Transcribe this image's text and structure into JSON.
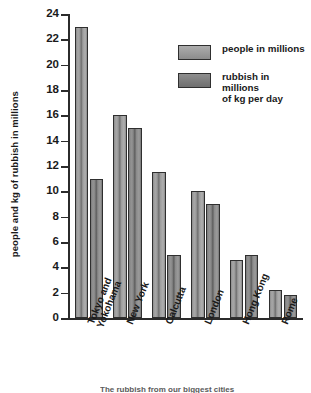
{
  "chart_data": {
    "type": "bar",
    "title": "",
    "xlabel": "",
    "ylabel": "people and kg of rubbish in millions",
    "ylim": [
      0,
      24
    ],
    "ytick_step": 2,
    "yticks": [
      0,
      2,
      4,
      6,
      8,
      10,
      12,
      14,
      16,
      18,
      20,
      22,
      24
    ],
    "grid": false,
    "legend_position": "top-right",
    "categories": [
      "Tokyo and Yokohama",
      "New York",
      "Calcutta",
      "London",
      "Hong Kong",
      "Rome"
    ],
    "series": [
      {
        "name": "people in millions",
        "values": [
          23,
          16,
          11.5,
          10,
          4.6,
          2.2
        ],
        "color": "#9b9b9b"
      },
      {
        "name": "rubbish in millions of kg per day",
        "values": [
          11,
          15,
          5,
          9,
          5,
          1.8
        ],
        "color": "#7d7d7d"
      }
    ]
  },
  "axis": {
    "y_title": "people and kg of rubbish in millions",
    "tick_labels": [
      "24",
      "22",
      "20",
      "18",
      "16",
      "14",
      "12",
      "10",
      "8",
      "6",
      "4",
      "2",
      "0"
    ]
  },
  "x_labels": [
    {
      "line1": "Tokyo and",
      "line2": "Yokohama"
    },
    {
      "line1": "New York",
      "line2": ""
    },
    {
      "line1": "Calcutta",
      "line2": ""
    },
    {
      "line1": "London",
      "line2": ""
    },
    {
      "line1": "Hong Kong",
      "line2": ""
    },
    {
      "line1": "Rome",
      "line2": ""
    }
  ],
  "legend": {
    "items": [
      {
        "label_line1": "people in millions",
        "label_line2": ""
      },
      {
        "label_line1": "rubbish in millions",
        "label_line2": "of kg per day"
      }
    ]
  },
  "caption": "The rubbish from our biggest cities"
}
